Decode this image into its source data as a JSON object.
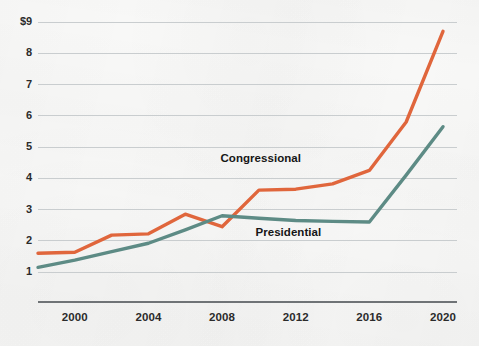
{
  "chart_data": {
    "type": "line",
    "title": "",
    "subtitle": "",
    "xlabel": "",
    "ylabel": "",
    "currency_prefix": "$",
    "xlim": [
      1998,
      2020
    ],
    "ylim": [
      0.6,
      9.2
    ],
    "grid": true,
    "grid_axis": "y",
    "legend_position": "inline-annotation",
    "x_tick_labels": [
      "2000",
      "2004",
      "2008",
      "2012",
      "2016",
      "2020"
    ],
    "x_ticks": [
      2000,
      2004,
      2008,
      2012,
      2016,
      2020
    ],
    "y_tick_labels": [
      "$9",
      "8",
      "7",
      "6",
      "5",
      "4",
      "3",
      "2",
      "1"
    ],
    "y_ticks": [
      9,
      8,
      7,
      6,
      5,
      4,
      3,
      2,
      1
    ],
    "series": [
      {
        "name": "Congressional",
        "color": "#e0663c",
        "x": [
          1998,
          2000,
          2002,
          2004,
          2006,
          2008,
          2010,
          2012,
          2014,
          2016,
          2018,
          2020
        ],
        "values": [
          1.6,
          1.63,
          2.18,
          2.22,
          2.85,
          2.45,
          3.62,
          3.65,
          3.82,
          4.25,
          5.8,
          8.7
        ]
      },
      {
        "name": "Presidential",
        "color": "#5d8b85",
        "x": [
          1998,
          2000,
          2002,
          2004,
          2006,
          2008,
          2010,
          2012,
          2014,
          2016,
          2018,
          2020
        ],
        "values": [
          1.15,
          1.38,
          1.65,
          1.92,
          2.35,
          2.8,
          2.72,
          2.65,
          2.62,
          2.6,
          4.1,
          5.65
        ]
      }
    ],
    "annotations": [
      {
        "text": "Congressional",
        "x": 2010.1,
        "y": 4.62
      },
      {
        "text": "Presidential",
        "x": 2011.6,
        "y": 2.24
      }
    ],
    "colors": {
      "background": "#f8f8f7",
      "gridline": "#c9cdcf",
      "axis_line": "#6f7376",
      "tick_text": "#2b2b2b",
      "annotation_text": "#161616"
    }
  }
}
